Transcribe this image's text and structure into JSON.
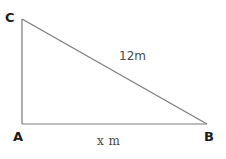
{
  "figure": {
    "type": "right-triangle-diagram",
    "background_color": "#ffffff",
    "stroke_color": "#7a7a7a",
    "label_color": "#1c1c1c",
    "measure_color": "#4a4a4a",
    "width": 226,
    "height": 159
  },
  "vertices": {
    "a": {
      "label": "A",
      "x": 22,
      "y": 124
    },
    "b": {
      "label": "B",
      "x": 207,
      "y": 124
    },
    "c": {
      "label": "C",
      "x": 22,
      "y": 19
    }
  },
  "sides": {
    "hypotenuse": {
      "label": "12m",
      "value": "12",
      "unit": "m",
      "from": "C",
      "to": "B"
    },
    "base": {
      "label": "x m",
      "value": "x",
      "unit": "m",
      "from": "A",
      "to": "B"
    },
    "vertical": {
      "label": "",
      "from": "A",
      "to": "C"
    }
  }
}
